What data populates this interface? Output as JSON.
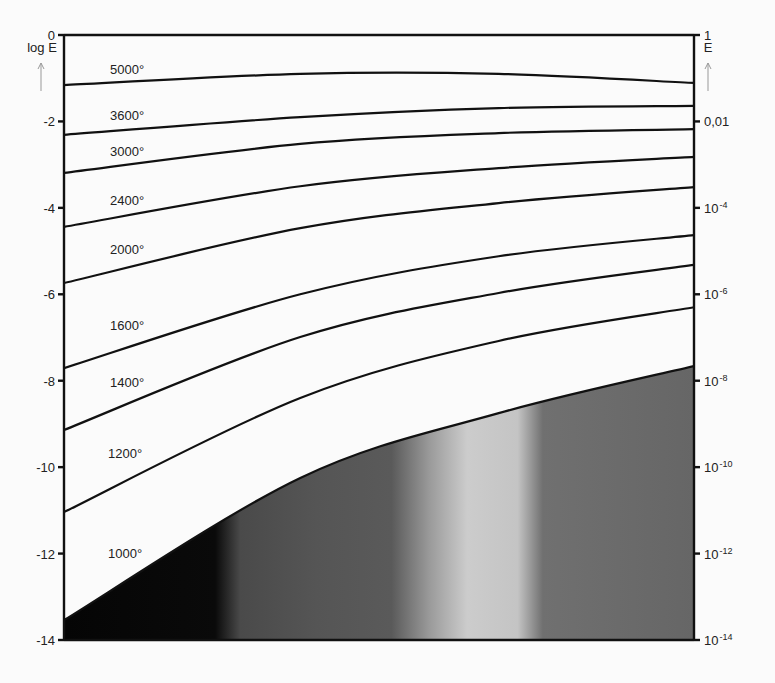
{
  "chart_data": {
    "type": "line",
    "title": "",
    "xlabel": "",
    "ylabel": "log E",
    "ylabel_right": "E",
    "ylim": [
      -14,
      0
    ],
    "xlim": [
      0,
      1
    ],
    "grid": false,
    "left_axis": {
      "title": "log E",
      "ticks": [
        {
          "value": 0,
          "label": "0"
        },
        {
          "value": -2,
          "label": "-2"
        },
        {
          "value": -4,
          "label": "-4"
        },
        {
          "value": -6,
          "label": "-6"
        },
        {
          "value": -8,
          "label": "-8"
        },
        {
          "value": -10,
          "label": "-10"
        },
        {
          "value": -12,
          "label": "-12"
        },
        {
          "value": -14,
          "label": "-14"
        }
      ]
    },
    "right_axis": {
      "title": "E",
      "ticks": [
        {
          "value": 0,
          "base": "1",
          "exp": ""
        },
        {
          "value": -2,
          "base": "0,01",
          "exp": ""
        },
        {
          "value": -4,
          "base": "10",
          "exp": "-4"
        },
        {
          "value": -6,
          "base": "10",
          "exp": "-6"
        },
        {
          "value": -8,
          "base": "10",
          "exp": "-8"
        },
        {
          "value": -10,
          "base": "10",
          "exp": "-10"
        },
        {
          "value": -12,
          "base": "10",
          "exp": "-12"
        },
        {
          "value": -14,
          "base": "10",
          "exp": "-14"
        }
      ]
    },
    "x": [
      0.0,
      0.375,
      0.69,
      1.0
    ],
    "series": [
      {
        "name": "5000°",
        "label": "5000°",
        "values": [
          -1.16,
          -0.9,
          -0.9,
          -1.11
        ]
      },
      {
        "name": "3600°",
        "label": "3600°",
        "values": [
          -2.31,
          -1.9,
          -1.69,
          -1.64
        ]
      },
      {
        "name": "3000°",
        "label": "3000°",
        "values": [
          -3.19,
          -2.52,
          -2.27,
          -2.18
        ]
      },
      {
        "name": "2400°",
        "label": "2400°",
        "values": [
          -4.44,
          -3.5,
          -3.08,
          -2.82
        ]
      },
      {
        "name": "2000°",
        "label": "2000°",
        "values": [
          -5.74,
          -4.47,
          -3.89,
          -3.52
        ]
      },
      {
        "name": "1600°",
        "label": "1600°",
        "values": [
          -7.71,
          -6.0,
          -5.12,
          -4.63
        ]
      },
      {
        "name": "1400°",
        "label": "1400°",
        "values": [
          -9.14,
          -6.99,
          -5.97,
          -5.32
        ]
      },
      {
        "name": "1200°",
        "label": "1200°",
        "values": [
          -11.04,
          -8.4,
          -7.08,
          -6.3
        ]
      },
      {
        "name": "1000°",
        "label": "1000°",
        "values": [
          -13.54,
          -10.25,
          -8.75,
          -7.66
        ],
        "filled_below": true
      }
    ],
    "fill": {
      "below_series": "1000°",
      "gradient_stops": [
        {
          "x": 0.0,
          "color": "#050505"
        },
        {
          "x": 0.24,
          "color": "#0a0a0a"
        },
        {
          "x": 0.28,
          "color": "#4a4a4a"
        },
        {
          "x": 0.4,
          "color": "#555555"
        },
        {
          "x": 0.52,
          "color": "#5a5a5a"
        },
        {
          "x": 0.58,
          "color": "#9a9a9a"
        },
        {
          "x": 0.64,
          "color": "#cccccc"
        },
        {
          "x": 0.72,
          "color": "#c4c4c4"
        },
        {
          "x": 0.76,
          "color": "#707070"
        },
        {
          "x": 1.0,
          "color": "#666666"
        }
      ]
    },
    "label_positions": {
      "5000°": {
        "x": 110,
        "y": 74
      },
      "3600°": {
        "x": 110,
        "y": 120
      },
      "3000°": {
        "x": 110,
        "y": 156
      },
      "2400°": {
        "x": 110,
        "y": 205
      },
      "2000°": {
        "x": 110,
        "y": 254
      },
      "1600°": {
        "x": 110,
        "y": 330
      },
      "1400°": {
        "x": 110,
        "y": 387
      },
      "1200°": {
        "x": 108,
        "y": 458
      },
      "1000°": {
        "x": 108,
        "y": 558
      }
    }
  }
}
